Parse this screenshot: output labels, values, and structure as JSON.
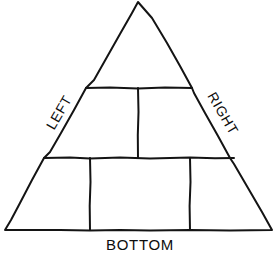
{
  "diagram": {
    "type": "triangle-with-panels",
    "background_color": "#ffffff",
    "stroke_color": "#141414",
    "text_color": "#0d0d0d",
    "stroke_width": 2,
    "labels": {
      "left": "LEFT",
      "right": "RIGHT",
      "bottom": "BOTTOM"
    },
    "label_rotation": {
      "left": -59.8,
      "right": 59.8,
      "bottom": 0
    },
    "outline": {
      "apex": [
        138,
        2
      ],
      "bottom_left": [
        5,
        230
      ],
      "bottom_right": [
        272,
        230
      ]
    },
    "dividers": {
      "upper_horizontal": {
        "y": 88,
        "x1": 86,
        "x2": 192
      },
      "middle_horizontal": {
        "y": 158,
        "x1": 44,
        "x2": 234
      },
      "upper_vertical": {
        "x": 138,
        "y1": 88,
        "y2": 158
      },
      "lower_vertical_left": {
        "x": 90,
        "y1": 158,
        "y2": 230
      },
      "lower_vertical_right": {
        "x": 190,
        "y1": 158,
        "y2": 230
      }
    },
    "panels": [
      {
        "name": "apex-panel",
        "row": "top"
      },
      {
        "name": "middle-left-panel",
        "row": "middle"
      },
      {
        "name": "middle-right-panel",
        "row": "middle"
      },
      {
        "name": "bottom-left-panel",
        "row": "bottom"
      },
      {
        "name": "bottom-center-panel",
        "row": "bottom"
      },
      {
        "name": "bottom-right-panel",
        "row": "bottom"
      }
    ]
  }
}
